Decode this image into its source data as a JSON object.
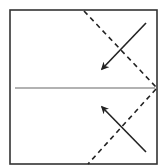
{
  "diagram": {
    "type": "origami-fold-diagram",
    "canvas": {
      "width": 165,
      "height": 168,
      "background": "#ffffff"
    },
    "paper": {
      "x": 10,
      "y": 10,
      "width": 147,
      "height": 154,
      "stroke": "#333333",
      "stroke_width": 1.6
    },
    "center_crease": {
      "x1": 15,
      "y1": 88,
      "x2": 155,
      "y2": 88,
      "stroke": "#999999",
      "stroke_width": 1.6,
      "style": "solid",
      "meaning": "crease"
    },
    "valley_folds": [
      {
        "name": "upper-valley-fold",
        "x1": 84,
        "y1": 11,
        "x2": 156,
        "y2": 87,
        "stroke": "#222222",
        "stroke_width": 1.6,
        "dash": "5,4"
      },
      {
        "name": "lower-valley-fold",
        "x1": 156,
        "y1": 89,
        "x2": 88,
        "y2": 164,
        "stroke": "#222222",
        "stroke_width": 1.6,
        "dash": "5,4"
      }
    ],
    "arrows": [
      {
        "name": "upper-fold-arrow",
        "x1": 146,
        "y1": 23,
        "x2": 102,
        "y2": 69,
        "stroke": "#222222",
        "stroke_width": 1.6,
        "direction": "down-left"
      },
      {
        "name": "lower-fold-arrow",
        "x1": 146,
        "y1": 152,
        "x2": 102,
        "y2": 107,
        "stroke": "#222222",
        "stroke_width": 1.6,
        "direction": "up-left"
      }
    ]
  }
}
